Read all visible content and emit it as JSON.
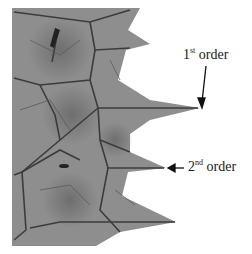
{
  "figure": {
    "annotations": [
      {
        "prefix": "1",
        "suffix": "st",
        "word": "order"
      },
      {
        "prefix": "2",
        "suffix": "nd",
        "word": "order"
      }
    ],
    "colors": {
      "leaf": "#8a8a8a",
      "vein": "#3a3a3a",
      "background": "#ffffff",
      "text": "#1a1a1a"
    }
  }
}
